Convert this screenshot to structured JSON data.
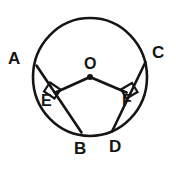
{
  "figure": {
    "type": "geometry-diagram",
    "background_color": "#ffffff",
    "stroke_color": "#151515"
  },
  "circle": {
    "label": "circle",
    "center_label": "O",
    "center_x": 90,
    "center_y": 77,
    "radius_x": 57,
    "radius_y": 59
  },
  "points": {
    "A": {
      "label": "A",
      "role": "chord-endpoint-upper-left"
    },
    "B": {
      "label": "B",
      "role": "chord-endpoint-lower-left"
    },
    "C": {
      "label": "C",
      "role": "chord-endpoint-upper-right"
    },
    "D": {
      "label": "D",
      "role": "chord-endpoint-lower-right"
    },
    "E": {
      "label": "E",
      "role": "foot-of-perpendicular-left"
    },
    "F": {
      "label": "F",
      "role": "foot-of-perpendicular-right"
    },
    "O": {
      "label": "O",
      "role": "center"
    }
  },
  "segments": {
    "chord_ab": {
      "label": "AB",
      "from": "A",
      "to": "B"
    },
    "chord_cd": {
      "label": "CD",
      "from": "C",
      "to": "D"
    },
    "radius_oe": {
      "label": "OE",
      "from": "O",
      "to": "E"
    },
    "radius_of": {
      "label": "OF",
      "from": "O",
      "to": "F"
    }
  },
  "right_angles": [
    {
      "label": "right-angle-at-E",
      "vertex": "E"
    },
    {
      "label": "right-angle-at-F",
      "vertex": "F"
    }
  ]
}
